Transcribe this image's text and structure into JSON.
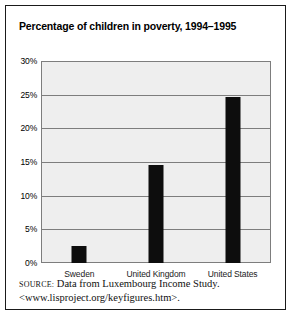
{
  "figure": {
    "title": "Percentage of children in poverty, 1994–1995",
    "source_label": "Source:",
    "source_text": " Data from Luxembourg Income Study. <www.lisproject.org/keyfigures.htm>.",
    "border_color": "#1a1a1a",
    "plot_background": "#eeeeee",
    "grid_color": "#7d7d7d",
    "bar_color": "#0d0d0d"
  },
  "chart_data": {
    "type": "bar",
    "title": "Percentage of children in poverty, 1994–1995",
    "xlabel": "",
    "ylabel": "",
    "categories": [
      "Sweden",
      "United Kingdom",
      "United States"
    ],
    "values": [
      2.5,
      14.5,
      24.6
    ],
    "ylim": [
      0,
      30
    ],
    "ytick_values": [
      0,
      5,
      10,
      15,
      20,
      25,
      30
    ],
    "ytick_labels": [
      "0%",
      "5%",
      "10%",
      "15%",
      "20%",
      "25%",
      "30%"
    ],
    "grid": true,
    "legend": "none",
    "value_suffix": "%"
  }
}
